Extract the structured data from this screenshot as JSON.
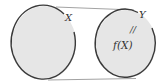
{
  "diagram": {
    "type": "function-mapping",
    "domain_set": {
      "label": "X",
      "fill": "#e6e6e6",
      "stroke": "#3a3a3a"
    },
    "codomain_set": {
      "label": "Y",
      "fill": "#e6e6e6",
      "stroke": "#3a3a3a"
    },
    "image_label": "f(X)",
    "pointer_mark": "//",
    "connector_color": "#8a8a8a"
  }
}
